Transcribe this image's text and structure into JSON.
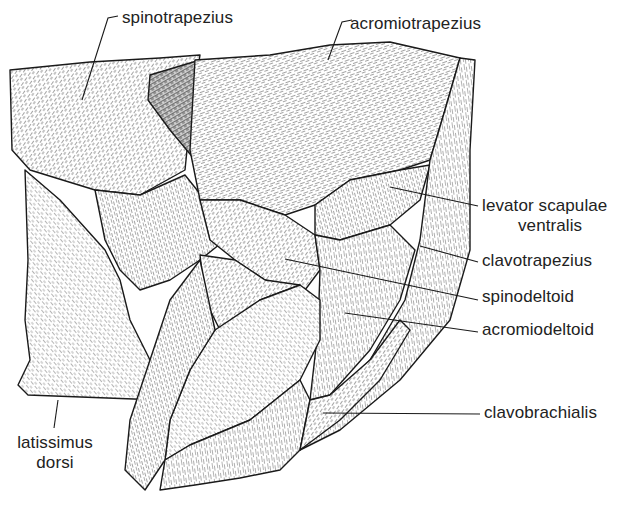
{
  "figure": {
    "type": "anatomical-illustration",
    "ink_color": "#1a1a1a",
    "background": "#ffffff"
  },
  "labels": {
    "spinotrapezius": "spinotrapezius",
    "acromiotrapezius": "acromiotrapezius",
    "levator_line1": "levator scapulae",
    "levator_line2": "ventralis",
    "clavotrapezius": "clavotrapezius",
    "spinodeltoid": "spinodeltoid",
    "acromiodeltoid": "acromiodeltoid",
    "clavobrachialis": "clavobrachialis",
    "latissimus_line1": "latissimus",
    "latissimus_line2": "dorsi"
  }
}
